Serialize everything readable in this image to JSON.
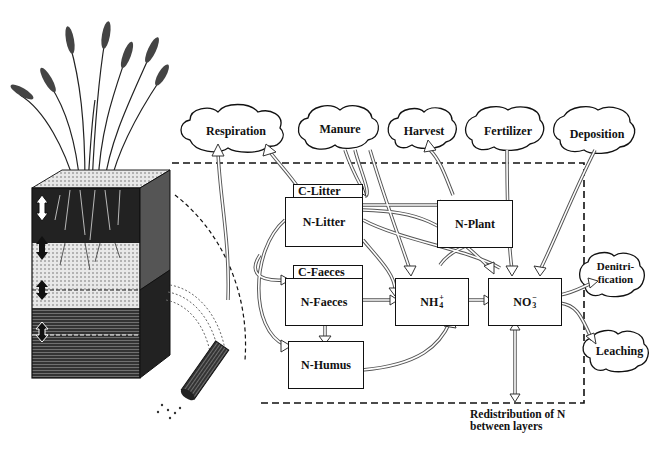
{
  "diagram": {
    "sources_sinks": {
      "respiration": "Respiration",
      "manure": "Manure",
      "harvest": "Harvest",
      "fertilizer": "Fertilizer",
      "deposition": "Deposition",
      "denitrification_line1": "Denitri-",
      "denitrification_line2": "fication",
      "leaching": "Leaching"
    },
    "pools": {
      "c_litter": "C-Litter",
      "n_litter": "N-Litter",
      "n_plant": "N-Plant",
      "c_faeces": "C-Faeces",
      "n_faeces": "N-Faeces",
      "n_humus": "N-Humus",
      "nh4_base": "NH",
      "nh4_sup": "+",
      "nh4_sub": "4",
      "no3_base": "NO",
      "no3_sup": "−",
      "no3_sub": "3"
    },
    "caption_line1": "Redistribution of N",
    "caption_line2": "between layers",
    "illustration": "soil-profile-with-wheat-and-root"
  }
}
